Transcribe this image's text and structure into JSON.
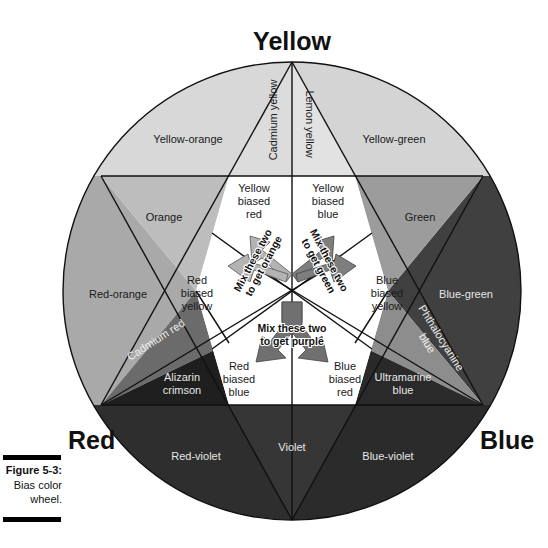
{
  "primaries": {
    "yellow": "Yellow",
    "red": "Red",
    "blue": "Blue"
  },
  "segments": {
    "yellow_orange": "Yellow-orange",
    "yellow_green": "Yellow-green",
    "orange": "Orange",
    "green": "Green",
    "red_orange": "Red-orange",
    "blue_green": "Blue-green",
    "red_violet": "Red-violet",
    "violet": "Violet",
    "blue_violet": "Blue-violet"
  },
  "pigments": {
    "cadmium_yellow": "Cadmium yellow",
    "lemon_yellow": "Lemon yellow",
    "cadmium_red": "Cadmium red",
    "alizarin_crimson_1": "Alizarin",
    "alizarin_crimson_2": "crimson",
    "phthalo_1": "Phthalocyanine",
    "phthalo_2": "blue",
    "ultramarine_1": "Ultramarine",
    "ultramarine_2": "blue"
  },
  "biases": {
    "yellow_red": [
      "Yellow",
      "biased",
      "red"
    ],
    "yellow_blue": [
      "Yellow",
      "biased",
      "blue"
    ],
    "red_yellow": [
      "Red",
      "biased",
      "yellow"
    ],
    "blue_yellow": [
      "Blue",
      "biased",
      "yellow"
    ],
    "red_blue": [
      "Red",
      "biased",
      "blue"
    ],
    "blue_red": [
      "Blue",
      "biased",
      "red"
    ]
  },
  "mix_notes": {
    "orange": [
      "Mix these two",
      "to get orange"
    ],
    "green": [
      "Mix these two",
      "to get green"
    ],
    "purple": [
      "Mix these two",
      "to get purple"
    ]
  },
  "caption": {
    "title": "Figure 5-3:",
    "line1": "Bias color",
    "line2": "wheel."
  },
  "colors": {
    "yellow_zone": "#d6d6d6",
    "orange_zone": "#b8b8b8",
    "green_zone": "#9a9a9a",
    "red_orange_zone": "#a8a8a8",
    "blue_green_zone": "#3e3e3e",
    "cadmium_red": "#6a6a6a",
    "alizarin": "#1e1e1e",
    "phthalo": "#8c8c8c",
    "ultramarine": "#2a2a2a",
    "violet_zone": "#333333",
    "arrow_orange": "#b0b0b0",
    "arrow_green": "#7a7a7a",
    "arrow_purple": "#6e6e6e"
  }
}
